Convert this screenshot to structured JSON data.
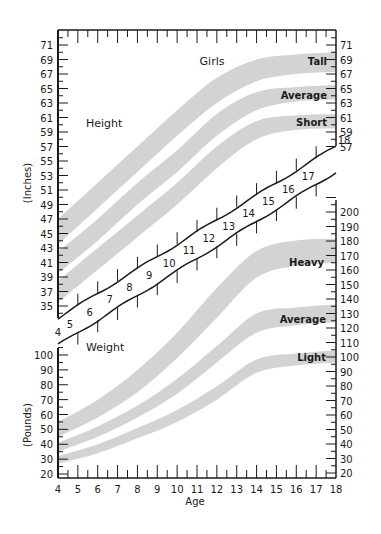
{
  "chart_data": [
    {
      "type": "area",
      "title": "Girls",
      "panel": "Height",
      "xlabel": "Age",
      "ylabel": "(Inches)",
      "x": [
        4,
        6,
        8,
        10,
        12,
        14,
        16,
        18
      ],
      "xlim": [
        4,
        18
      ],
      "ylim": [
        33,
        72
      ],
      "left_ticks": [
        35,
        37,
        39,
        41,
        43,
        45,
        47,
        49,
        51,
        53,
        55,
        57,
        59,
        61,
        63,
        65,
        67,
        69,
        71
      ],
      "right_ticks": [
        57,
        59,
        61,
        63,
        65,
        67,
        69,
        71
      ],
      "grid": false,
      "series": [
        {
          "name": "Tall",
          "lower": [
            43.5,
            48.5,
            53.5,
            58.5,
            63.0,
            66.0,
            67.0,
            67.3
          ],
          "upper": [
            47.0,
            52.0,
            57.0,
            62.0,
            66.5,
            69.0,
            69.7,
            70.0
          ]
        },
        {
          "name": "Average",
          "lower": [
            39.5,
            44.0,
            49.0,
            53.5,
            58.5,
            62.0,
            63.2,
            63.5
          ],
          "upper": [
            42.5,
            47.0,
            52.0,
            56.5,
            61.5,
            64.5,
            65.2,
            65.5
          ]
        },
        {
          "name": "Short",
          "lower": [
            35.5,
            40.0,
            44.5,
            49.0,
            54.0,
            58.0,
            59.3,
            59.5
          ],
          "upper": [
            38.5,
            43.0,
            47.5,
            52.0,
            57.0,
            60.5,
            61.3,
            61.5
          ]
        }
      ]
    },
    {
      "type": "area",
      "title": "Girls",
      "panel": "Weight",
      "xlabel": "Age",
      "ylabel": "(Pounds)",
      "x": [
        4,
        6,
        8,
        10,
        12,
        14,
        16,
        18
      ],
      "xlim": [
        4,
        18
      ],
      "ylim": [
        15,
        210
      ],
      "left_ticks": [
        20,
        30,
        40,
        50,
        60,
        70,
        80,
        90,
        100
      ],
      "right_ticks": [
        20,
        30,
        40,
        50,
        60,
        70,
        80,
        90,
        100,
        110,
        120,
        130,
        140,
        150,
        160,
        170,
        180,
        190,
        200
      ],
      "grid": false,
      "series": [
        {
          "name": "Heavy",
          "lower": [
            45,
            58,
            75,
            98,
            125,
            152,
            160,
            162
          ],
          "upper": [
            55,
            70,
            90,
            115,
            145,
            170,
            177,
            178
          ]
        },
        {
          "name": "Average",
          "lower": [
            35,
            45,
            58,
            74,
            95,
            115,
            120,
            122
          ],
          "upper": [
            41,
            52,
            66,
            84,
            106,
            128,
            132,
            134
          ]
        },
        {
          "name": "Light",
          "lower": [
            27,
            34,
            44,
            55,
            70,
            88,
            93,
            95
          ],
          "upper": [
            32,
            40,
            51,
            63,
            79,
            97,
            101,
            103
          ]
        }
      ]
    }
  ],
  "labels": {
    "title": "Girls",
    "height_panel": "Height",
    "weight_panel": "Weight",
    "height_axis": "(Inches)",
    "weight_axis": "(Pounds)",
    "x_axis": "Age",
    "height_bands": [
      "Tall",
      "Average",
      "Short"
    ],
    "weight_bands": [
      "Heavy",
      "Average",
      "Light"
    ]
  },
  "age_ticks": [
    4,
    5,
    6,
    7,
    8,
    9,
    10,
    11,
    12,
    13,
    14,
    15,
    16,
    17,
    18
  ],
  "colors": {
    "band": "#d3d3d3",
    "ink": "#1a1a1a",
    "background": "#ffffff"
  }
}
